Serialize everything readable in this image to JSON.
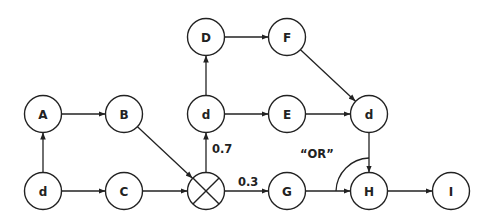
{
  "diagram": {
    "type": "probabilistic flow graph",
    "node_radius": 18.5,
    "nodes": [
      {
        "id": "D",
        "label": "D",
        "x": 206,
        "y": 37
      },
      {
        "id": "F",
        "label": "F",
        "x": 287,
        "y": 37
      },
      {
        "id": "A",
        "label": "A",
        "x": 43,
        "y": 114
      },
      {
        "id": "B",
        "label": "B",
        "x": 124,
        "y": 114
      },
      {
        "id": "d_mid",
        "label": "d",
        "x": 206,
        "y": 114
      },
      {
        "id": "E",
        "label": "E",
        "x": 287,
        "y": 114
      },
      {
        "id": "d_right",
        "label": "d",
        "x": 369,
        "y": 114
      },
      {
        "id": "d_bottom",
        "label": "d",
        "x": 43,
        "y": 191
      },
      {
        "id": "C",
        "label": "C",
        "x": 124,
        "y": 191
      },
      {
        "id": "X",
        "label": "",
        "x": 206,
        "y": 191,
        "kind": "xor-gateway"
      },
      {
        "id": "G",
        "label": "G",
        "x": 287,
        "y": 191
      },
      {
        "id": "H",
        "label": "H",
        "x": 369,
        "y": 191
      },
      {
        "id": "I",
        "label": "I",
        "x": 451,
        "y": 191
      }
    ],
    "edges": [
      {
        "from": "d_bottom",
        "to": "A"
      },
      {
        "from": "d_bottom",
        "to": "C"
      },
      {
        "from": "A",
        "to": "B"
      },
      {
        "from": "B",
        "to": "X"
      },
      {
        "from": "C",
        "to": "X"
      },
      {
        "from": "X",
        "to": "d_mid",
        "label": "0.7"
      },
      {
        "from": "X",
        "to": "G",
        "label": "0.3"
      },
      {
        "from": "d_mid",
        "to": "D"
      },
      {
        "from": "d_mid",
        "to": "E"
      },
      {
        "from": "D",
        "to": "F"
      },
      {
        "from": "F",
        "to": "d_right"
      },
      {
        "from": "E",
        "to": "d_right"
      },
      {
        "from": "d_right",
        "to": "H"
      },
      {
        "from": "G",
        "to": "H"
      },
      {
        "from": "H",
        "to": "I"
      }
    ],
    "annotations": {
      "prob_up": "0.7",
      "prob_right": "0.3",
      "join_label": "“OR”"
    }
  }
}
